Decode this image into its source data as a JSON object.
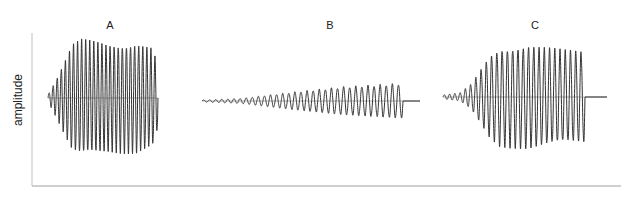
{
  "chart_data": {
    "type": "line",
    "title": "",
    "xlabel": "",
    "ylabel": "amplitude",
    "grid": false,
    "legend": null,
    "axes": {
      "x_ticks": [],
      "y_ticks": []
    },
    "colors": {
      "trace": "#333333",
      "axis": "#bfbfbf",
      "baseline": "#9a9a9a"
    },
    "panels": [
      {
        "label": "A",
        "description": "Fast onset oscillation, nearly constant high amplitude, gradual decay at end",
        "cycles": 27,
        "x_start": 48,
        "x_end": 158,
        "tail_end": 158,
        "midline_y": 98,
        "envelope": [
          [
            0,
            0.06
          ],
          [
            0.08,
            0.35
          ],
          [
            0.22,
            0.92
          ],
          [
            0.3,
            1.0
          ],
          [
            0.55,
            0.93
          ],
          [
            0.8,
            0.95
          ],
          [
            0.95,
            0.85
          ],
          [
            1.0,
            0.55
          ]
        ],
        "max_half_height": 56
      },
      {
        "label": "B",
        "description": "Slowly increasing amplitude ramp, abrupt cutoff",
        "cycles": 33,
        "x_start": 202,
        "x_end": 403,
        "tail_end": 420,
        "midline_y": 101,
        "envelope": [
          [
            0,
            0.05
          ],
          [
            0.2,
            0.15
          ],
          [
            0.45,
            0.5
          ],
          [
            0.7,
            0.8
          ],
          [
            1.0,
            1.0
          ]
        ],
        "max_half_height": 17
      },
      {
        "label": "C",
        "description": "Small onset, rapid rise to high amplitude, irregular peaks, abrupt cutoff",
        "cycles": 27,
        "x_start": 443,
        "x_end": 585,
        "tail_end": 607,
        "midline_y": 97,
        "envelope": [
          [
            0,
            0.04
          ],
          [
            0.12,
            0.08
          ],
          [
            0.2,
            0.25
          ],
          [
            0.33,
            0.8
          ],
          [
            0.4,
            0.95
          ],
          [
            0.6,
            1.0
          ],
          [
            0.85,
            0.9
          ],
          [
            1.0,
            0.88
          ]
        ],
        "max_half_height": 50
      }
    ]
  }
}
